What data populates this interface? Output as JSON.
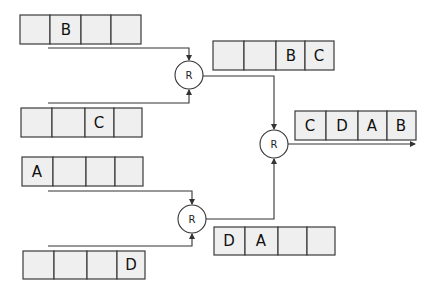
{
  "diagram": {
    "title": "",
    "node_label": "R",
    "queues": {
      "input_1": [
        "",
        "B",
        "",
        ""
      ],
      "input_2": [
        "",
        "",
        "C",
        ""
      ],
      "input_3": [
        "A",
        "",
        "",
        ""
      ],
      "input_4": [
        "",
        "",
        "",
        "D"
      ],
      "merge_top": [
        "",
        "",
        "B",
        "C"
      ],
      "merge_bottom": [
        "D",
        "A",
        "",
        ""
      ],
      "output": [
        "C",
        "D",
        "A",
        "B"
      ]
    },
    "nodes": [
      {
        "id": "r1",
        "label": "R"
      },
      {
        "id": "r2",
        "label": "R"
      },
      {
        "id": "r3",
        "label": "R"
      }
    ]
  }
}
